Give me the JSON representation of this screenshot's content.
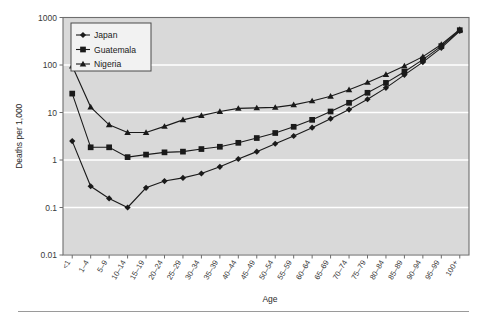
{
  "figure": {
    "plot_background": "#d9d9d9",
    "grid_color": "#ffffff",
    "frame_color": "#6e6e6e",
    "series_color": "#1a1a1a"
  },
  "legend": {
    "position": "top-left-inside",
    "entries": [
      {
        "label": "Japan",
        "marker": "diamond"
      },
      {
        "label": "Guatemala",
        "marker": "square"
      },
      {
        "label": "Nigeria",
        "marker": "triangle"
      }
    ]
  },
  "chart_data": {
    "type": "line",
    "title": "",
    "xlabel": "Age",
    "ylabel": "Deaths per 1,000",
    "yscale": "log",
    "ylim": [
      0.01,
      1000
    ],
    "ytick_labels": [
      "1000",
      "100",
      "10",
      "1",
      "0.1",
      "0.01"
    ],
    "ytick_values": [
      1000,
      100,
      10,
      1,
      0.1,
      0.01
    ],
    "grid": true,
    "legend_position": "upper left",
    "categories": [
      "<1",
      "1–4",
      "5–9",
      "10–14",
      "15–19",
      "20–24",
      "25–29",
      "30–34",
      "35–39",
      "40–44",
      "45–49",
      "50–54",
      "55–59",
      "60–64",
      "65–69",
      "70–74",
      "75–79",
      "80–84",
      "85–89",
      "90–94",
      "95–99",
      "100+"
    ],
    "series": [
      {
        "name": "Japan",
        "marker": "diamond",
        "values": [
          2.5,
          0.28,
          0.155,
          0.1,
          0.26,
          0.36,
          0.42,
          0.52,
          0.72,
          1.05,
          1.5,
          2.2,
          3.2,
          4.8,
          7.4,
          11.5,
          19,
          33,
          62,
          115,
          230,
          520
        ]
      },
      {
        "name": "Guatemala",
        "marker": "square",
        "values": [
          25,
          1.85,
          1.85,
          1.15,
          1.3,
          1.45,
          1.5,
          1.7,
          1.9,
          2.3,
          2.9,
          3.7,
          5.0,
          7.0,
          10.5,
          16,
          26,
          42,
          72,
          130,
          250,
          540
        ]
      },
      {
        "name": "Nigeria",
        "marker": "triangle",
        "values": [
          95,
          13,
          5.5,
          3.8,
          3.8,
          5.1,
          7.0,
          8.6,
          10.5,
          12.2,
          12.5,
          12.8,
          14.5,
          17.5,
          22,
          30,
          43,
          63,
          95,
          150,
          270,
          560
        ]
      }
    ]
  }
}
